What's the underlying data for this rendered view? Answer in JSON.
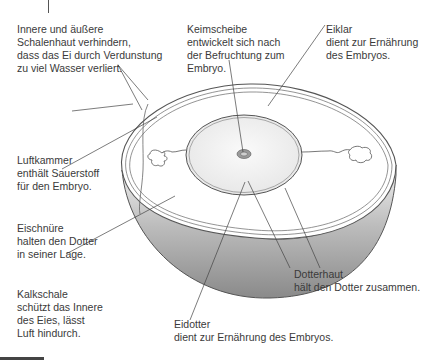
{
  "diagram": {
    "labels": {
      "schalenhaut": {
        "lines": [
          "Innere und äußere",
          "Schalenhaut verhindern,",
          "dass das Ei durch Verdunstung",
          "zu viel Wasser verliert."
        ]
      },
      "keimscheibe": {
        "lines": [
          "Keimscheibe",
          "entwickelt sich nach",
          "der Befruchtung zum",
          "Embryo."
        ]
      },
      "eiklar": {
        "lines": [
          "Eiklar",
          "dient zur Ernährung",
          "des Embryos."
        ]
      },
      "luftkammer": {
        "lines": [
          "Luftkammer",
          "enthält Sauerstoff",
          "für den Embryo."
        ]
      },
      "eischnuere": {
        "lines": [
          "Eischnüre",
          "halten den Dotter",
          "in seiner Lage."
        ]
      },
      "kalkschale": {
        "lines": [
          "Kalkschale",
          "schützt das Innere",
          "des Eies, lässt",
          "Luft hindurch."
        ]
      },
      "dotterhaut": {
        "lines": [
          "Dotterhaut",
          "hält den Dotter zusammen."
        ]
      },
      "eidotter": {
        "lines": [
          "Eidotter",
          "dient zur Ernährung des Embryos."
        ]
      }
    },
    "colors": {
      "shell_outline": "#555555",
      "shell_shading_dark": "#8c8c8c",
      "shell_shading_light": "#e8e8e8",
      "yolk_fill": "#f0f0f0",
      "albumen_fill": "#ffffff",
      "leader_line": "#444444"
    }
  }
}
